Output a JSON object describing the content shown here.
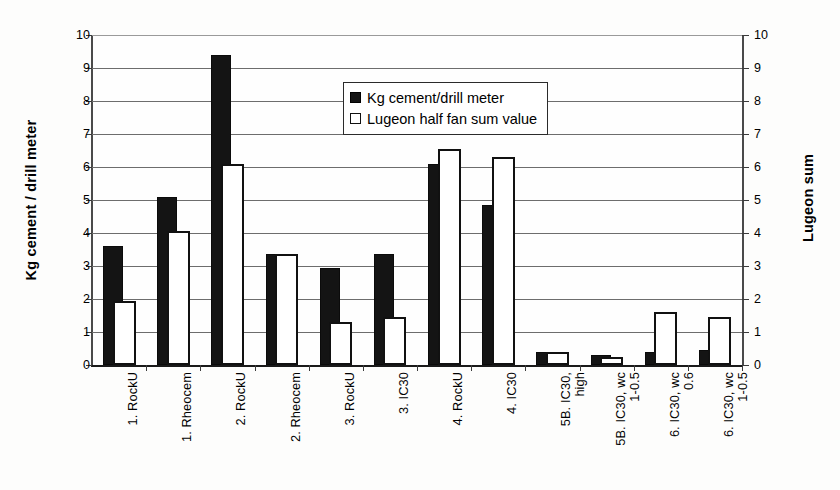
{
  "chart_data": {
    "type": "bar",
    "title": "",
    "subtitle": "",
    "ylabel": "Kg cement / drill meter",
    "ylabel_secondary": "Lugeon sum",
    "xlabel": "",
    "ylim": [
      0,
      10
    ],
    "ylim_secondary": [
      0,
      10
    ],
    "yticks": [
      "0",
      "1",
      "2",
      "3",
      "4",
      "5",
      "6",
      "7",
      "8",
      "9",
      "10"
    ],
    "yticks_secondary": [
      "0",
      "1",
      "2",
      "3",
      "4",
      "5",
      "6",
      "7",
      "8",
      "9",
      "10"
    ],
    "grid": true,
    "legend_position": "top-center",
    "categories": [
      "1. RockU",
      "1. Rheocem",
      "2. RockU",
      "2. Rheocem",
      "3. RockU",
      "3. IC30",
      "4. RockU",
      "4. IC30",
      "5B. IC30,\nhigh",
      "5B. IC30, wc\n1-0.5",
      "6. IC30, wc\n0.6",
      "6. IC30, wc\n1-0.5"
    ],
    "series": [
      {
        "name": "Kg cement/drill meter",
        "color": "#141414",
        "axis": "left",
        "values": [
          3.6,
          5.1,
          9.4,
          3.35,
          2.95,
          3.35,
          6.1,
          4.85,
          0.4,
          0.3,
          0.4,
          0.45
        ]
      },
      {
        "name": "Lugeon half fan sum value",
        "color": "#ffffff",
        "axis": "right",
        "values": [
          1.95,
          4.05,
          6.1,
          3.35,
          1.3,
          1.45,
          6.55,
          6.3,
          0.4,
          0.25,
          1.6,
          1.45
        ]
      }
    ]
  },
  "legend": {
    "items": [
      {
        "label": "Kg cement/drill meter",
        "swatch": "dark"
      },
      {
        "label": "Lugeon half fan sum value",
        "swatch": "light"
      }
    ]
  }
}
